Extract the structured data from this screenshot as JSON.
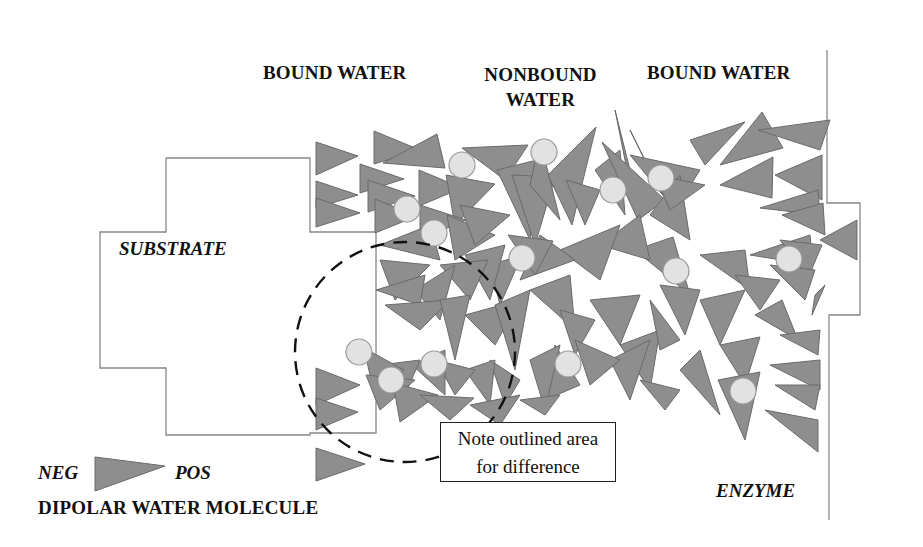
{
  "labels": {
    "bound_water_left": "BOUND WATER",
    "nonbound_water_line1": "NONBOUND",
    "nonbound_water_line2": "WATER",
    "bound_water_right": "BOUND WATER",
    "substrate": "SUBSTRATE",
    "enzyme": "ENZYME",
    "note_line1": "Note outlined area",
    "note_line2": "for difference",
    "legend_neg": "NEG",
    "legend_pos": "POS",
    "legend_title": "DIPOLAR WATER MOLECULE"
  },
  "colors": {
    "triangle_fill": "#8e8e8e",
    "triangle_stroke": "#6a6a6a",
    "circle_fill": "#e2e2e2",
    "circle_stroke": "#9a9a9a",
    "outline": "#888888",
    "dashed_circle": "#111111"
  },
  "substrate_outline": "166,158 310,158 310,232 376,232 376,433 310,433 310,435 166,435 166,368 100,368 100,232 166,232 166,158",
  "enzyme_outline": "827,50 827,203 860,203 860,315 829,315 829,520",
  "dashed_circle": {
    "cx": 405,
    "cy": 352,
    "rx": 110,
    "ry": 110
  },
  "triangles": [
    "316,142 358,156 316,175",
    "374,131 420,150 374,164",
    "383,163 437,134 445,168",
    "316,181 358,195 316,208",
    "316,198 360,213 316,227",
    "360,164 404,179 360,193",
    "368,180 415,196 368,212",
    "375,199 417,216 375,233",
    "419,170 462,188 419,206",
    "462,148 528,145 505,180",
    "446,175 495,184 455,225",
    "420,205 466,220 420,240",
    "447,215 495,235 455,260",
    "460,205 510,215 475,245",
    "497,170 537,160 530,240",
    "512,175 555,177 535,245",
    "530,185 540,140 560,220",
    "548,175 596,127 572,225",
    "566,180 600,190 585,225",
    "595,170 620,150 625,215",
    "615,110 630,185 640,210",
    "630,130 660,190 652,175",
    "602,142 638,220 665,200",
    "630,155 700,170 675,210",
    "650,215 680,175 690,240",
    "655,175 705,185 670,210",
    "690,140 745,122 705,165",
    "720,165 762,112 783,148",
    "758,130 830,120 820,150",
    "720,185 773,157 772,198",
    "775,175 822,155 822,200",
    "760,208 818,190 820,215",
    "782,215 823,203 825,235",
    "750,255 810,235 813,265",
    "820,240 857,220 857,260",
    "780,240 822,245 808,278",
    "700,255 745,250 750,290",
    "635,250 673,237 690,295",
    "600,245 640,215 650,260",
    "560,250 620,225 600,280",
    "540,235 575,260 520,280",
    "508,235 553,241 535,275",
    "490,265 522,255 500,305",
    "465,255 505,245 490,300",
    "440,265 488,260 470,300",
    "415,290 455,265 440,320",
    "380,245 430,225 440,260",
    "380,260 430,265 395,300",
    "376,290 425,275 420,305",
    "385,305 450,300 420,330",
    "440,300 470,295 455,360",
    "465,315 520,300 495,345",
    "495,305 530,290 515,370",
    "530,290 570,275 575,330",
    "560,310 595,320 575,355",
    "590,300 640,295 620,345",
    "620,345 660,330 650,390",
    "650,300 680,340 660,350",
    "660,285 700,290 685,335",
    "700,300 745,290 720,345",
    "735,275 780,280 760,310",
    "770,265 815,270 805,300",
    "815,295 825,285 812,315",
    "755,315 782,300 798,340",
    "720,345 760,337 745,385",
    "780,335 820,330 818,355",
    "770,365 820,360 820,390",
    "775,385 820,385 815,410",
    "765,410 818,420 818,452",
    "718,380 760,372 745,440",
    "680,370 700,350 720,415",
    "640,380 680,390 665,410",
    "610,360 650,340 630,400",
    "575,340 620,360 590,385",
    "555,345 580,385 545,400",
    "530,360 560,345 545,410",
    "490,360 520,380 505,405",
    "465,370 495,360 490,405",
    "436,360 475,370 455,395",
    "412,365 445,350 445,395",
    "380,365 420,360 405,395",
    "364,348 404,370 375,398",
    "366,375 415,380 380,410",
    "393,383 438,395 400,422",
    "420,395 474,398 450,420",
    "470,405 520,395 500,425",
    "520,400 560,395 545,415",
    "316,368 360,385 316,405",
    "316,398 358,412 316,430",
    "316,448 365,464 316,481"
  ],
  "circles": [
    {
      "cx": 462,
      "cy": 165,
      "r": 13
    },
    {
      "cx": 544,
      "cy": 152,
      "r": 13
    },
    {
      "cx": 407,
      "cy": 209,
      "r": 13
    },
    {
      "cx": 434,
      "cy": 233,
      "r": 13
    },
    {
      "cx": 613,
      "cy": 190,
      "r": 13
    },
    {
      "cx": 661,
      "cy": 178,
      "r": 13
    },
    {
      "cx": 522,
      "cy": 258,
      "r": 13
    },
    {
      "cx": 676,
      "cy": 271,
      "r": 13
    },
    {
      "cx": 789,
      "cy": 259,
      "r": 13
    },
    {
      "cx": 359,
      "cy": 352,
      "r": 13
    },
    {
      "cx": 391,
      "cy": 380,
      "r": 13
    },
    {
      "cx": 434,
      "cy": 364,
      "r": 13
    },
    {
      "cx": 568,
      "cy": 364,
      "r": 13
    },
    {
      "cx": 743,
      "cy": 391,
      "r": 13
    }
  ],
  "legend_triangle": "95,457 165,466 95,491"
}
